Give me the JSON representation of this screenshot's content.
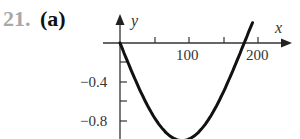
{
  "problem": {
    "number": "21.",
    "part": "(a)"
  },
  "chart_data": {
    "type": "line",
    "title": "",
    "xlabel": "x",
    "ylabel": "y",
    "x_ticks": [
      50,
      100,
      150,
      200
    ],
    "x_tick_labels": {
      "100": "100",
      "200": "200"
    },
    "y_ticks": [
      -0.2,
      -0.4,
      -0.6,
      -0.8
    ],
    "y_tick_labels": {
      "-0.4": "-0.4",
      "-0.8": "-0.8"
    },
    "series": [
      {
        "name": "y = -sin(x°)",
        "x": [
          0,
          15,
          30,
          45,
          60,
          75,
          90,
          105,
          120,
          135,
          150,
          165,
          180,
          190
        ],
        "y": [
          0,
          -0.26,
          -0.5,
          -0.71,
          -0.87,
          -0.97,
          -1.0,
          -0.97,
          -0.87,
          -0.71,
          -0.5,
          -0.26,
          0,
          0.17
        ]
      }
    ],
    "xlim": [
      -25,
      245
    ],
    "ylim": [
      -1.0,
      0.3
    ],
    "grid": false,
    "legend": "none"
  },
  "labels": {
    "x_axis": "x",
    "y_axis": "y",
    "x100": "100",
    "x200": "200",
    "y04": "−0.4",
    "y08": "−0.8"
  }
}
